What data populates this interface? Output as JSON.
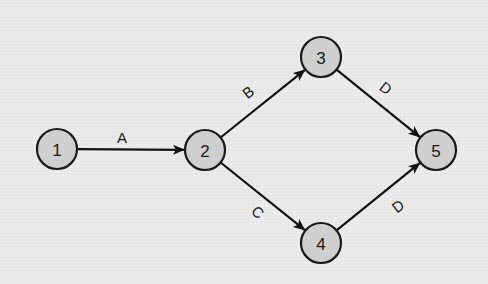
{
  "diagram": {
    "type": "activity-on-arrow network",
    "colors": {
      "background": "#e9e9e9",
      "node_fill": "#cfcfcf",
      "stroke": "#1a1a1a"
    },
    "nodes": [
      {
        "id": "1",
        "label": "1",
        "x": 57,
        "y": 149
      },
      {
        "id": "2",
        "label": "2",
        "x": 205,
        "y": 150
      },
      {
        "id": "3",
        "label": "3",
        "x": 321,
        "y": 57
      },
      {
        "id": "4",
        "label": "4",
        "x": 321,
        "y": 243
      },
      {
        "id": "5",
        "label": "5",
        "x": 436,
        "y": 150
      }
    ],
    "edges": [
      {
        "from": "1",
        "to": "2",
        "label": "A",
        "lx": 122,
        "ly": 137,
        "angle": 0
      },
      {
        "from": "2",
        "to": "3",
        "label": "B",
        "lx": 248,
        "ly": 92,
        "angle": -38
      },
      {
        "from": "2",
        "to": "4",
        "label": "C",
        "lx": 258,
        "ly": 212,
        "angle": 38
      },
      {
        "from": "3",
        "to": "5",
        "label": "D",
        "lx": 386,
        "ly": 88,
        "angle": 38
      },
      {
        "from": "4",
        "to": "5",
        "label": "D",
        "lx": 398,
        "ly": 206,
        "angle": -38
      }
    ]
  }
}
